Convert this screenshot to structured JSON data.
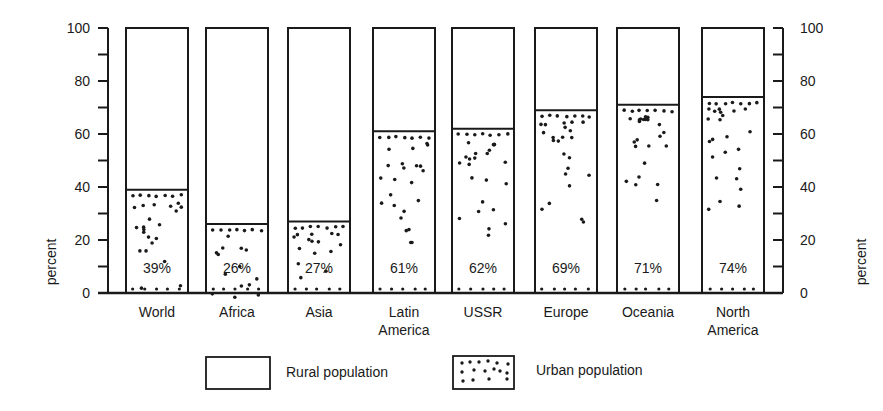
{
  "chart_data": {
    "type": "bar",
    "stacked": true,
    "title": "",
    "xlabel": "",
    "ylabel": "percent",
    "ylabel_right": "percent",
    "ylim": [
      0,
      100
    ],
    "yticks": [
      0,
      20,
      40,
      60,
      80,
      100
    ],
    "minor_tick_step": 10,
    "grid": false,
    "legend_position": "bottom",
    "categories": [
      "World",
      "Africa",
      "Asia",
      "Latin America",
      "USSR",
      "Europe",
      "Oceania",
      "North America"
    ],
    "category_lines": [
      [
        "World"
      ],
      [
        "Africa"
      ],
      [
        "Asia"
      ],
      [
        "Latin",
        "America"
      ],
      [
        "USSR"
      ],
      [
        "Europe"
      ],
      [
        "Oceania"
      ],
      [
        "North",
        "America"
      ]
    ],
    "series": [
      {
        "name": "Urban population",
        "pattern": "dotted",
        "values": [
          39,
          26,
          27,
          61,
          62,
          69,
          71,
          74
        ]
      },
      {
        "name": "Rural population",
        "pattern": "blank",
        "values": [
          61,
          74,
          73,
          39,
          38,
          31,
          29,
          26
        ]
      }
    ],
    "data_labels": [
      "39%",
      "26%",
      "27%",
      "61%",
      "62%",
      "69%",
      "71%",
      "74%"
    ]
  },
  "legend": {
    "items": [
      {
        "label": "Rural population",
        "pattern": "blank"
      },
      {
        "label": "Urban population",
        "pattern": "dotted"
      }
    ]
  },
  "colors": {
    "ink": "#1a1a1a",
    "background": "#ffffff"
  }
}
